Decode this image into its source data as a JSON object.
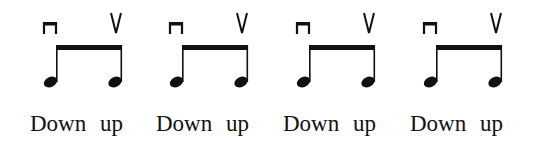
{
  "figure": {
    "groups": [
      {
        "down_label": "Down",
        "up_label": "up",
        "down_symbol": "down-bow",
        "up_symbol": "up-bow"
      },
      {
        "down_label": "Down",
        "up_label": "up",
        "down_symbol": "down-bow",
        "up_symbol": "up-bow"
      },
      {
        "down_label": "Down",
        "up_label": "up",
        "down_symbol": "down-bow",
        "up_symbol": "up-bow"
      },
      {
        "down_label": "Down",
        "up_label": "up",
        "down_symbol": "down-bow",
        "up_symbol": "up-bow"
      }
    ]
  }
}
